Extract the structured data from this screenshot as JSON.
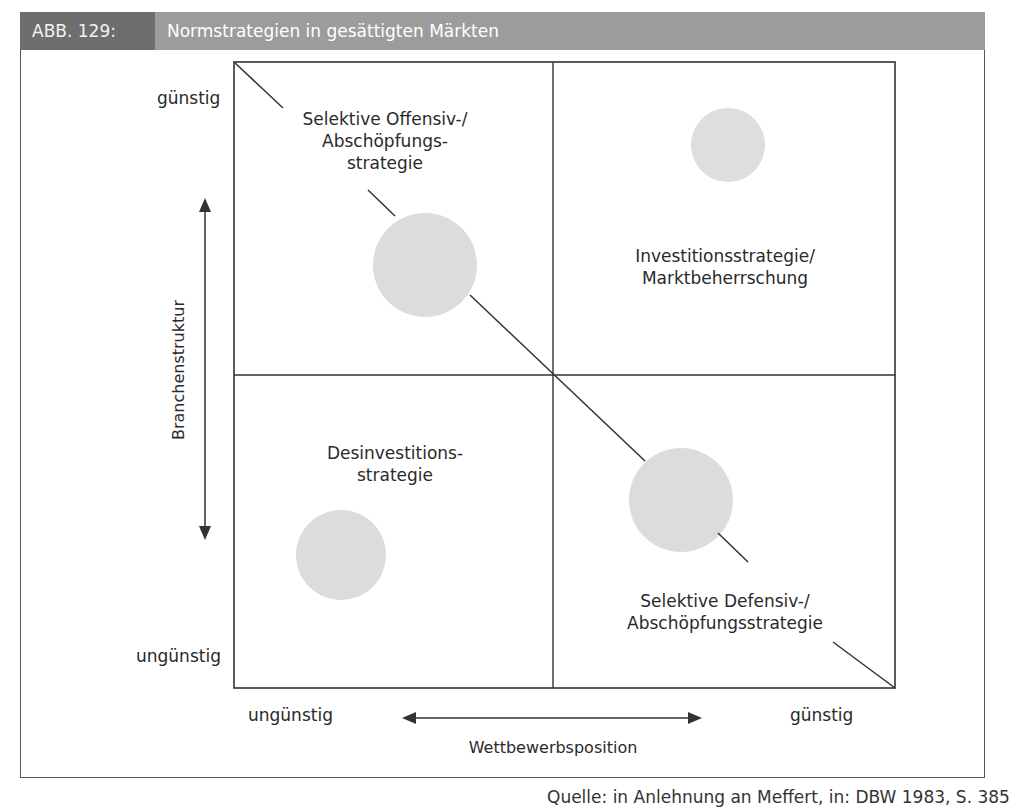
{
  "header": {
    "figure_label": "ABB. 129:",
    "title": "Normstrategien in gesättigten Märkten"
  },
  "diagram": {
    "type": "2x2 strategy matrix",
    "y_axis": {
      "label": "Branchenstruktur",
      "high": "günstig",
      "low": "ungünstig"
    },
    "x_axis": {
      "label": "Wettbewerbsposition",
      "low": "ungünstig",
      "high": "günstig"
    },
    "quadrants": {
      "top_left": {
        "lines": [
          "Selektive Offensiv-/",
          "Abschöpfungs-",
          "strategie"
        ]
      },
      "top_right": {
        "lines": [
          "Investitionsstrategie/",
          "Marktbeherrschung"
        ]
      },
      "bottom_left": {
        "lines": [
          "Desinvestitions-",
          "strategie"
        ]
      },
      "bottom_right": {
        "lines": [
          "Selektive Defensiv-/",
          "Abschöpfungsstrategie"
        ]
      }
    },
    "circles": [
      {
        "quadrant": "top_left",
        "size": "large"
      },
      {
        "quadrant": "top_right",
        "size": "small"
      },
      {
        "quadrant": "bottom_left",
        "size": "medium"
      },
      {
        "quadrant": "bottom_right",
        "size": "large"
      }
    ],
    "colors": {
      "line": "#333333",
      "circle": "#dcdcdc",
      "header_dark": "#6e6e6e",
      "header_light": "#9c9c9c"
    }
  },
  "source": "Quelle: in Anlehnung an Meffert, in: DBW 1983, S. 385"
}
